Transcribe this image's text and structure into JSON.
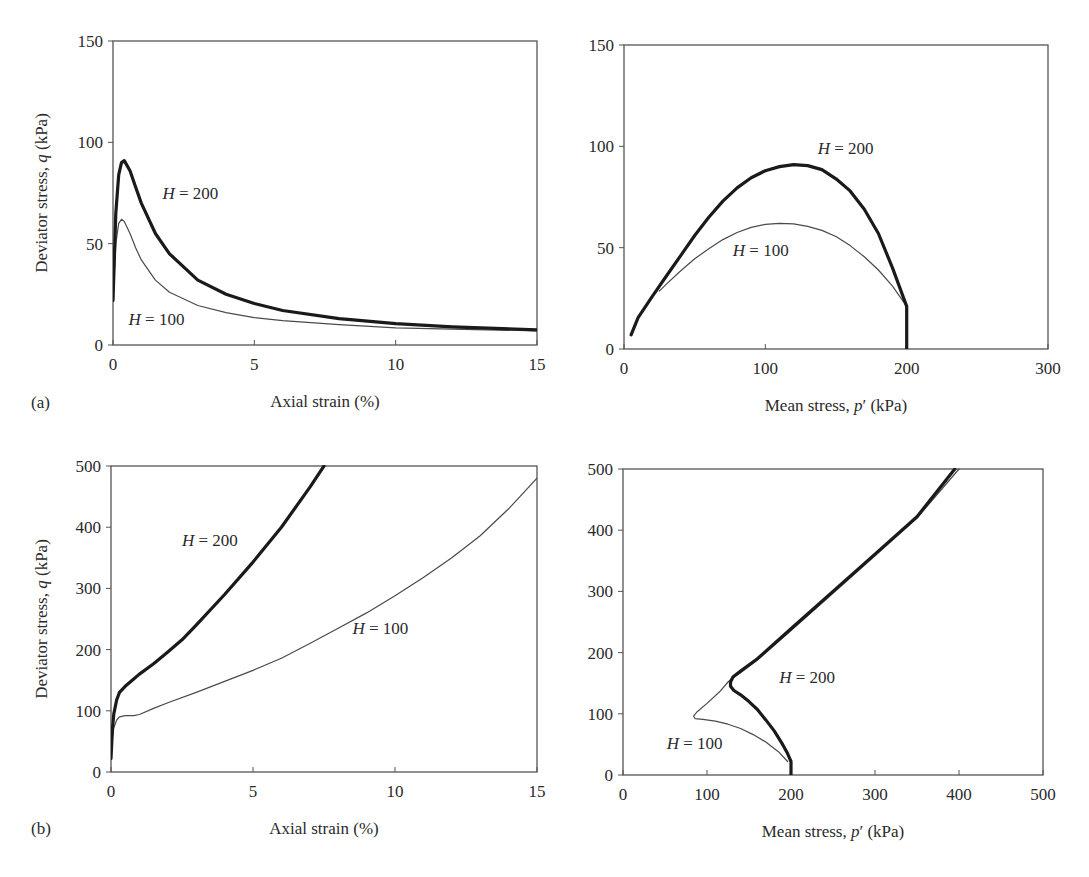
{
  "figure": {
    "panel_labels": [
      "(a)",
      "(b)"
    ]
  },
  "chart_data": [
    {
      "id": "a-left",
      "type": "line",
      "panel": "(a)",
      "title": "",
      "xlabel": "Axial strain (%)",
      "ylabel": "Deviator stress, q (kPa)",
      "xlim": [
        0,
        15
      ],
      "ylim": [
        0,
        150
      ],
      "xticks": [
        0,
        5,
        10,
        15
      ],
      "yticks": [
        0,
        50,
        100,
        150
      ],
      "grid": false,
      "legend": "none (inline annotations)",
      "box": {
        "x0": 113,
        "y0": 41,
        "x1": 537,
        "y1": 345
      },
      "series": [
        {
          "name": "H = 200",
          "style": "thick",
          "x": [
            0,
            0.1,
            0.2,
            0.3,
            0.4,
            0.6,
            0.8,
            1.0,
            1.5,
            2.0,
            3.0,
            4.0,
            5.0,
            6.0,
            8.0,
            10.0,
            12.0,
            15.0
          ],
          "y": [
            22,
            65,
            84,
            90,
            91,
            86,
            78,
            70,
            55,
            45,
            32,
            25,
            20.5,
            17,
            13,
            10.5,
            9,
            7.5
          ]
        },
        {
          "name": "H = 100",
          "style": "thin",
          "x": [
            0,
            0.1,
            0.2,
            0.3,
            0.4,
            0.6,
            0.8,
            1.0,
            1.5,
            2.0,
            3.0,
            4.0,
            5.0,
            6.0,
            8.0,
            10.0,
            12.0,
            15.0
          ],
          "y": [
            22,
            50,
            60,
            62,
            61,
            55,
            48,
            42,
            32,
            26,
            19.5,
            16,
            13.5,
            12,
            10,
            8.5,
            7.8,
            7
          ]
        }
      ],
      "annotations": [
        {
          "text": "H = 200",
          "x": 1.75,
          "y": 72
        },
        {
          "text": "H = 100",
          "x": 0.55,
          "y": 10
        }
      ]
    },
    {
      "id": "a-right",
      "type": "line",
      "panel": "(a)",
      "title": "",
      "xlabel": "Mean stress, p′ (kPa)",
      "ylabel": "",
      "xlim": [
        0,
        300
      ],
      "ylim": [
        0,
        150
      ],
      "xticks": [
        0,
        100,
        200,
        300
      ],
      "yticks": [
        0,
        50,
        100,
        150
      ],
      "grid": false,
      "legend": "none (inline annotations)",
      "box": {
        "x0": 624,
        "y0": 45,
        "x1": 1048,
        "y1": 349
      },
      "series": [
        {
          "name": "H = 200",
          "style": "thick",
          "x": [
            200,
            200,
            190,
            180,
            170,
            160,
            150,
            140,
            130,
            120,
            110,
            100,
            90,
            80,
            70,
            60,
            50,
            40,
            30,
            20,
            10,
            5
          ],
          "y": [
            0,
            21,
            40,
            57,
            69,
            78,
            84,
            88.5,
            90.5,
            91,
            90,
            88,
            84.5,
            79.5,
            73,
            65,
            56,
            46,
            36,
            26,
            15.5,
            7
          ]
        },
        {
          "name": "H = 100",
          "style": "thin",
          "x": [
            200,
            190,
            180,
            170,
            160,
            150,
            140,
            130,
            120,
            110,
            100,
            90,
            80,
            70,
            60,
            50,
            40,
            30,
            25
          ],
          "y": [
            21,
            31,
            39,
            45.5,
            51,
            55.5,
            58.5,
            60.5,
            61.8,
            62,
            61.5,
            60,
            57.5,
            54,
            49.5,
            44.5,
            38.5,
            32,
            28.5
          ]
        }
      ],
      "annotations": [
        {
          "text": "H = 200",
          "x": 137,
          "y": 96
        },
        {
          "text": "H = 100",
          "x": 77,
          "y": 46
        }
      ]
    },
    {
      "id": "b-left",
      "type": "line",
      "panel": "(b)",
      "title": "",
      "xlabel": "Axial strain (%)",
      "ylabel": "Deviator stress, q (kPa)",
      "xlim": [
        0,
        15
      ],
      "ylim": [
        0,
        500
      ],
      "xticks": [
        0,
        5,
        10,
        15
      ],
      "yticks": [
        0,
        100,
        200,
        300,
        400,
        500
      ],
      "grid": false,
      "legend": "none (inline annotations)",
      "box": {
        "x0": 111,
        "y0": 466,
        "x1": 537,
        "y1": 772
      },
      "series": [
        {
          "name": "H = 200",
          "style": "thick",
          "x": [
            0,
            0.05,
            0.1,
            0.2,
            0.3,
            0.5,
            0.8,
            1.0,
            1.5,
            2.0,
            2.5,
            3.0,
            4.0,
            5.0,
            6.0,
            7.0,
            7.5
          ],
          "y": [
            22,
            70,
            95,
            118,
            130,
            140,
            152,
            160,
            177,
            196,
            216,
            240,
            290,
            343,
            400,
            465,
            500
          ]
        },
        {
          "name": "H = 100",
          "style": "thin",
          "x": [
            0,
            0.05,
            0.1,
            0.2,
            0.3,
            0.5,
            0.8,
            1.0,
            1.5,
            2.0,
            3.0,
            4.0,
            5.0,
            6.0,
            7.0,
            8.0,
            9.0,
            10.0,
            11.0,
            12.0,
            13.0,
            14.0,
            15.0
          ],
          "y": [
            22,
            55,
            72,
            85,
            90,
            92,
            92,
            94,
            104,
            113,
            130,
            148,
            166,
            186,
            210,
            235,
            260,
            288,
            318,
            350,
            386,
            430,
            480
          ]
        }
      ],
      "annotations": [
        {
          "text": "H = 200",
          "x": 2.5,
          "y": 370
        },
        {
          "text": "H = 100",
          "x": 8.5,
          "y": 225
        }
      ]
    },
    {
      "id": "b-right",
      "type": "line",
      "panel": "(b)",
      "title": "",
      "xlabel": "Mean stress, p′ (kPa)",
      "ylabel": "",
      "xlim": [
        0,
        500
      ],
      "ylim": [
        0,
        500
      ],
      "xticks": [
        0,
        100,
        200,
        300,
        400,
        500
      ],
      "yticks": [
        0,
        100,
        200,
        300,
        400,
        500
      ],
      "grid": false,
      "legend": "none (inline annotations)",
      "box": {
        "x0": 623,
        "y0": 469,
        "x1": 1043,
        "y1": 775
      },
      "series": [
        {
          "name": "H = 200",
          "style": "thick",
          "x": [
            200,
            200,
            196,
            190,
            180,
            170,
            160,
            150,
            140,
            132,
            128,
            128,
            131,
            140,
            160,
            200,
            250,
            300,
            350,
            395
          ],
          "y": [
            0,
            22,
            35,
            50,
            72,
            90,
            107,
            120,
            131,
            138,
            145,
            152,
            160,
            170,
            190,
            239,
            300,
            361,
            422,
            500
          ]
        },
        {
          "name": "H = 100",
          "style": "thin",
          "x": [
            196,
            185,
            170,
            155,
            140,
            125,
            110,
            95,
            86,
            84,
            88,
            100,
            115,
            125,
            130,
            140,
            160,
            200,
            250,
            300,
            350,
            400
          ],
          "y": [
            22,
            38,
            54,
            66,
            76,
            83,
            88,
            91,
            92,
            96,
            103,
            117,
            136,
            152,
            158,
            167,
            188,
            236,
            297,
            358,
            420,
            500
          ]
        }
      ],
      "annotations": [
        {
          "text": "H = 200",
          "x": 186,
          "y": 150
        },
        {
          "text": "H = 100",
          "x": 52,
          "y": 43
        }
      ]
    }
  ]
}
